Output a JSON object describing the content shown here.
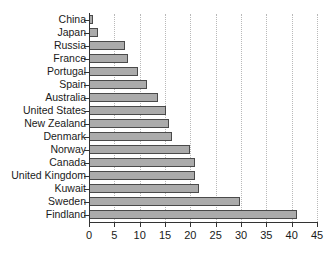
{
  "chart_data": {
    "type": "bar",
    "orientation": "horizontal",
    "title": "",
    "subtitle": "",
    "xlabel": "",
    "ylabel": "",
    "xlim": [
      0,
      45
    ],
    "xticks": [
      0,
      5,
      10,
      15,
      20,
      25,
      30,
      35,
      40,
      45
    ],
    "grid": "vertical-dotted",
    "legend": "none",
    "categories": [
      "China",
      "Japan",
      "Russia",
      "France",
      "Portugal",
      "Spain",
      "Australia",
      "United States",
      "New Zealand",
      "Denmark",
      "Norway",
      "Canada",
      "United Kingdom",
      "Kuwait",
      "Sweden",
      "Findland"
    ],
    "values": [
      0.8,
      1.7,
      7.2,
      7.6,
      9.7,
      11.4,
      13.7,
      15.2,
      15.8,
      16.4,
      19.9,
      21.0,
      21.0,
      21.8,
      29.9,
      41.0
    ],
    "series": [
      {
        "name": "value",
        "values": [
          0.8,
          1.7,
          7.2,
          7.6,
          9.7,
          11.4,
          13.7,
          15.2,
          15.8,
          16.4,
          19.9,
          21.0,
          21.0,
          21.8,
          29.9,
          41.0
        ]
      }
    ],
    "colors": {
      "bar_fill": "#ababab",
      "bar_border": "#4a4a4a",
      "gridline": "#b9b9b9",
      "axis": "#333333",
      "text": "#1a1a1a",
      "background": "#ffffff"
    }
  }
}
